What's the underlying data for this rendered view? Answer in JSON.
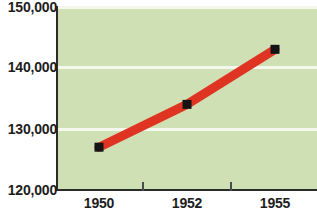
{
  "chart_data": {
    "type": "line",
    "title": "",
    "subtitle": "",
    "xlabel": "",
    "ylabel": "",
    "x": [
      1950,
      1952,
      1955
    ],
    "categories": [
      "1950",
      "1952",
      "1955"
    ],
    "values": [
      127000,
      134000,
      143000
    ],
    "series": [
      {
        "name": "series-1",
        "values": [
          127000,
          134000,
          143000
        ],
        "color": "#e03423",
        "marker": "square",
        "marker_color": "#141414"
      }
    ],
    "ylim": [
      120000,
      150000
    ],
    "yticks": [
      120000,
      130000,
      140000,
      150000
    ],
    "ytick_labels": [
      "120,000",
      "130,000",
      "140,000",
      "150,000"
    ],
    "xtick_labels": [
      "1950",
      "1952",
      "1955"
    ],
    "grid": true,
    "grid_color": "#f4f8ec",
    "plot_background": "#cfe0b4",
    "axis_color": "#2b2b2b",
    "legend": false,
    "legend_position": "none"
  },
  "axes": {
    "y_ticks": [
      {
        "label": "150,000",
        "value": 150000
      },
      {
        "label": "140,000",
        "value": 140000
      },
      {
        "label": "130,000",
        "value": 130000
      },
      {
        "label": "120,000",
        "value": 120000
      }
    ],
    "x_ticks": [
      {
        "label": "1950",
        "value": 1950
      },
      {
        "label": "1952",
        "value": 1952
      },
      {
        "label": "1955",
        "value": 1955
      }
    ]
  }
}
